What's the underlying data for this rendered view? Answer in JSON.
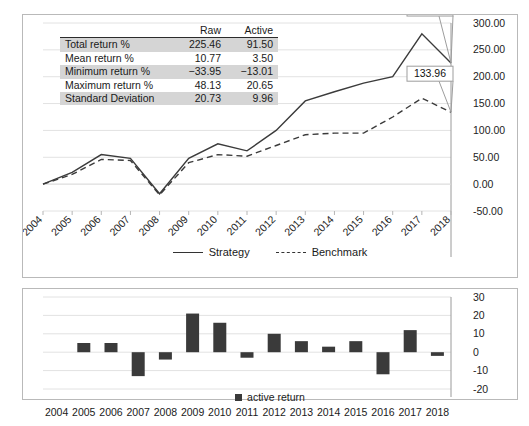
{
  "stats_table": {
    "columns": [
      "",
      "Raw",
      "Active"
    ],
    "rows": [
      {
        "label": "Total return %",
        "raw": "225.46",
        "active": "91.50"
      },
      {
        "label": "Mean return %",
        "raw": "10.77",
        "active": "3.50"
      },
      {
        "label": "Minimum return %",
        "raw": "−33.95",
        "active": "−13.01"
      },
      {
        "label": "Maximum return %",
        "raw": "48.13",
        "active": "20.65"
      },
      {
        "label": "Standard Deviation",
        "raw": "20.73",
        "active": "9.96"
      }
    ]
  },
  "line_legend": {
    "strategy": "Strategy",
    "benchmark": "Benchmark"
  },
  "bar_legend": {
    "active_return": "active return"
  },
  "callouts": [
    {
      "name": "strategy-end-callout",
      "text": "225.46"
    },
    {
      "name": "benchmark-end-callout",
      "text": "133.96"
    }
  ],
  "chart_data": [
    {
      "type": "line",
      "name": "cumulative-return-chart",
      "title": "",
      "xlabel": "",
      "ylabel": "",
      "x": [
        2004,
        2005,
        2006,
        2007,
        2008,
        2009,
        2010,
        2011,
        2012,
        2013,
        2014,
        2015,
        2016,
        2017,
        2018
      ],
      "categories": [
        "2004",
        "2005",
        "2006",
        "2007",
        "2008",
        "2009",
        "2010",
        "2011",
        "2012",
        "2013",
        "2014",
        "2015",
        "2016",
        "2017",
        "2018"
      ],
      "ylim": [
        -50,
        300
      ],
      "ytick_labels": [
        "-50.00",
        "0.00",
        "50.00",
        "100.00",
        "150.00",
        "200.00",
        "250.00",
        "300.00"
      ],
      "ytick_values": [
        -50,
        0,
        50,
        100,
        150,
        200,
        250,
        300
      ],
      "yaxis_position": "right",
      "grid": true,
      "legend_position": "bottom",
      "series": [
        {
          "name": "Strategy",
          "style": "solid",
          "values": [
            0,
            22,
            55,
            48,
            -18,
            48,
            75,
            62,
            100,
            155,
            172,
            188,
            200,
            280,
            225.46
          ]
        },
        {
          "name": "Benchmark",
          "style": "dashed",
          "values": [
            0,
            18,
            46,
            44,
            -20,
            40,
            55,
            52,
            72,
            92,
            95,
            95,
            125,
            160,
            133.96
          ]
        }
      ]
    },
    {
      "type": "bar",
      "name": "active-return-chart",
      "title": "",
      "xlabel": "",
      "ylabel": "",
      "categories": [
        "2004",
        "2005",
        "2006",
        "2007",
        "2008",
        "2009",
        "2010",
        "2011",
        "2012",
        "2013",
        "2014",
        "2015",
        "2016",
        "2017",
        "2018"
      ],
      "ylim": [
        -20,
        30
      ],
      "ytick_labels": [
        "-20",
        "-10",
        "0",
        "10",
        "20",
        "30"
      ],
      "ytick_values": [
        -20,
        -10,
        0,
        10,
        20,
        30
      ],
      "yaxis_position": "right",
      "grid": true,
      "legend_position": "bottom",
      "series": [
        {
          "name": "active return",
          "values": [
            0,
            5,
            5,
            -13,
            -4,
            21,
            16,
            -3,
            10,
            6,
            3,
            6,
            -12,
            12,
            -2
          ]
        }
      ]
    }
  ]
}
